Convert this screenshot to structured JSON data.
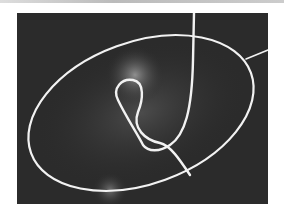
{
  "image": {
    "description": "Grayscale photograph of a glowing optical fiber forming a tilted ellipse with a figure-eight loop inside, on a dark background",
    "colors": {
      "background": "#2a2a2a",
      "fiber": "#f4f4f4",
      "page": "#ffffff"
    }
  }
}
